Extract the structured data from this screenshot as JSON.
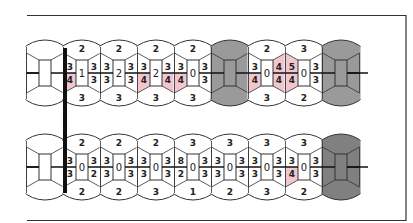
{
  "diagram": {
    "type": "bead-chain puzzle",
    "frame": {
      "sides": [
        "top",
        "right",
        "bottom"
      ],
      "color": "#222222"
    },
    "colors": {
      "outline": "#333333",
      "highlight": "#f2c6cf",
      "grey_cell": "#9a9a9a",
      "dark_grey_cell": "#808080",
      "bar": "#111111"
    },
    "divider_bar": {
      "x": 65,
      "y1": 48,
      "y2": 193
    },
    "rows": [
      {
        "id": "row-1",
        "cy": 73,
        "cells": [
          {
            "kind": "blank"
          },
          {
            "kind": "num",
            "top": "2",
            "center": "1",
            "bottom": "3",
            "lt": "3",
            "lb": "4",
            "rt": "3",
            "rb": "3",
            "hl": [
              "lb"
            ]
          },
          {
            "kind": "num",
            "top": "2",
            "center": "2",
            "bottom": "3",
            "lt": "3",
            "lb": "3",
            "rt": "3",
            "rb": "3",
            "hl": []
          },
          {
            "kind": "num",
            "top": "2",
            "center": "2",
            "bottom": "3",
            "lt": "3",
            "lb": "4",
            "rt": "3",
            "rb": "4",
            "hl": [
              "lb",
              "rb"
            ],
            "lt_alt": "8"
          },
          {
            "kind": "num",
            "top": "2",
            "center": "0",
            "bottom": "3",
            "lt": "3",
            "lb": "4",
            "rt": "3",
            "rb": "3",
            "hl": [
              "lb"
            ]
          },
          {
            "kind": "grey"
          },
          {
            "kind": "num",
            "top": "2",
            "center": "0",
            "bottom": "3",
            "lt": "3",
            "lb": "4",
            "rt": "4",
            "rb": "4",
            "hl": [
              "lb",
              "rt",
              "rb"
            ]
          },
          {
            "kind": "num",
            "top": "3",
            "center": "0",
            "bottom": "2",
            "lt": "5",
            "lb": "4",
            "rt": "3",
            "rb": "3",
            "hl": [
              "lt",
              "lb"
            ]
          },
          {
            "kind": "grey"
          }
        ]
      },
      {
        "id": "row-2",
        "cy": 167,
        "cells": [
          {
            "kind": "blank"
          },
          {
            "kind": "num",
            "top": "2",
            "center": "0",
            "bottom": "2",
            "lt": "3",
            "lb": "3",
            "rt": "3",
            "rb": "2",
            "hl": []
          },
          {
            "kind": "num",
            "top": "2",
            "center": "0",
            "bottom": "2",
            "lt": "3",
            "lb": "3",
            "rt": "3",
            "rb": "3",
            "hl": []
          },
          {
            "kind": "num",
            "top": "2",
            "center": "0",
            "bottom": "3",
            "lt": "3",
            "lb": "3",
            "rt": "3",
            "rb": "3",
            "hl": []
          },
          {
            "kind": "num",
            "top": "3",
            "center": "0",
            "bottom": "1",
            "lt": "8",
            "lb": "2",
            "rt": "3",
            "rb": "3",
            "hl": []
          },
          {
            "kind": "num",
            "top": "3",
            "center": "0",
            "bottom": "2",
            "lt": "3",
            "lb": "3",
            "rt": "3",
            "rb": "3",
            "hl": []
          },
          {
            "kind": "num",
            "top": "3",
            "center": "0",
            "bottom": "3",
            "lt": "3",
            "lb": "3",
            "rt": "3",
            "rb": "3",
            "hl": []
          },
          {
            "kind": "num",
            "top": "3",
            "center": "0",
            "bottom": "2",
            "lt": "3",
            "lb": "4",
            "rt": "3",
            "rb": "3",
            "hl": [
              "lb"
            ]
          },
          {
            "kind": "dark"
          }
        ]
      }
    ]
  }
}
